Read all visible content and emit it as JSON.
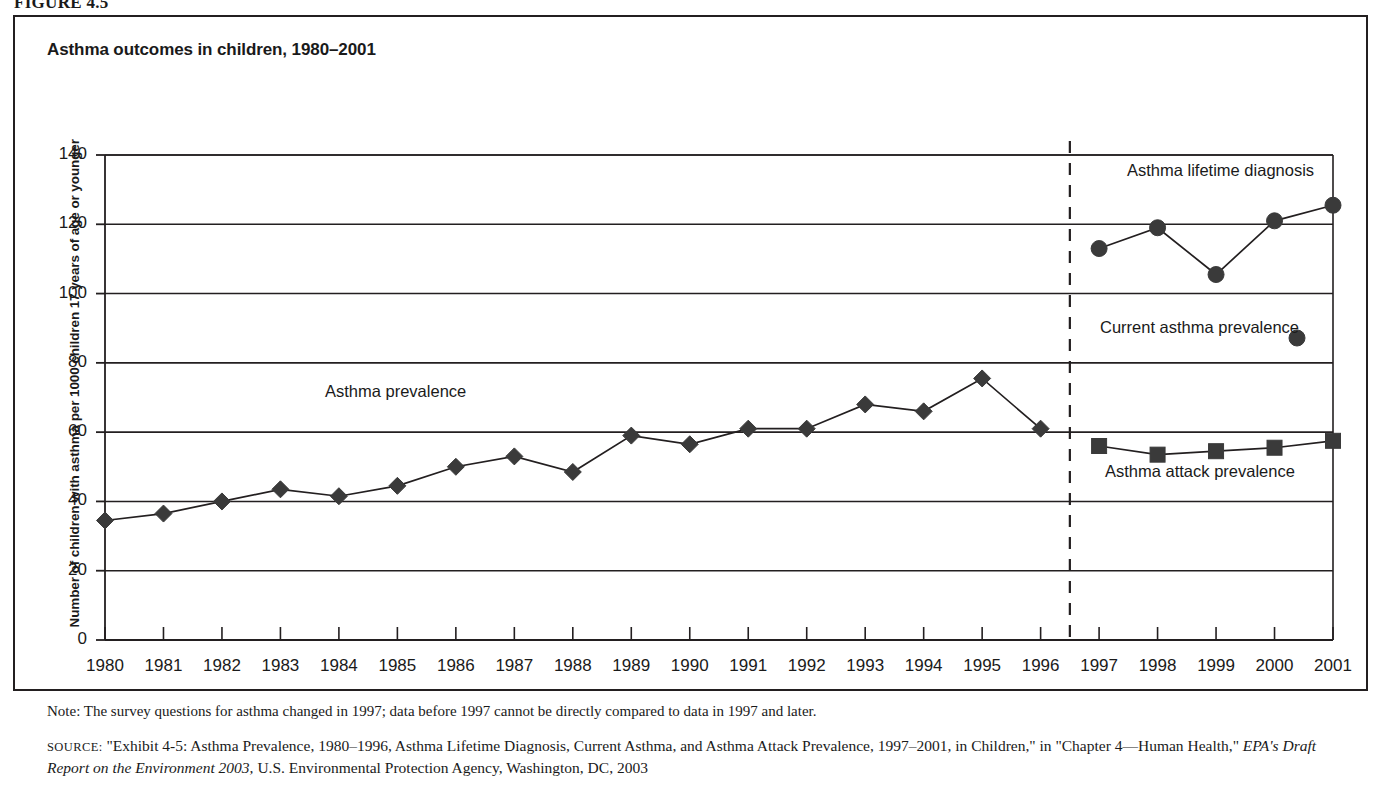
{
  "figure": {
    "label": "FIGURE 4.5",
    "title": "Asthma outcomes in children, 1980–2001"
  },
  "axes": {
    "ylabel": "Number of children with asthma per 1000 children 17 years of age or younger",
    "yticks": [
      "0",
      "20",
      "40",
      "60",
      "80",
      "100",
      "120",
      "140"
    ],
    "xticks": [
      "1980",
      "1981",
      "1982",
      "1983",
      "1984",
      "1985",
      "1986",
      "1987",
      "1988",
      "1989",
      "1990",
      "1991",
      "1992",
      "1993",
      "1994",
      "1995",
      "1996",
      "1997",
      "1998",
      "1999",
      "2000",
      "2001"
    ]
  },
  "annotations": {
    "asthma_prevalence": "Asthma prevalence",
    "lifetime_diagnosis": "Asthma lifetime diagnosis",
    "current_prevalence": "Current asthma prevalence",
    "attack_prevalence": "Asthma attack prevalence"
  },
  "note": "Note: The survey questions for asthma changed in 1997; data before 1997 cannot be directly compared to data in 1997 and later.",
  "source": {
    "prefix": "SOURCE:",
    "part1": " \"Exhibit 4-5: Asthma Prevalence, 1980–1996, Asthma Lifetime Diagnosis, Current Asthma, and Asthma Attack Prevalence, 1997–2001, in Children,\" in \"Chapter 4—Human Health,\" ",
    "italic": "EPA's Draft Report on the Environment 2003,",
    "part2": " U.S. Environmental Protection Agency, Washington, DC, 2003"
  },
  "colors": {
    "ink": "#231f20",
    "marker": "#3a3a3a",
    "background": "#ffffff"
  },
  "chart_data": {
    "type": "line",
    "title": "Asthma outcomes in children, 1980–2001",
    "xlabel": "",
    "ylabel": "Number of children with asthma per 1000 children 17 years of age or younger",
    "ylim": [
      0,
      140
    ],
    "ytick_step": 20,
    "grid": "horizontal",
    "legend": "inline-annotations",
    "break_after_year": 1996,
    "break_note": "Survey questions changed in 1997; vertical dashed line marks the break",
    "series": [
      {
        "name": "Asthma prevalence",
        "marker": "diamond",
        "x": [
          1980,
          1981,
          1982,
          1983,
          1984,
          1985,
          1986,
          1987,
          1988,
          1989,
          1990,
          1991,
          1992,
          1993,
          1994,
          1995,
          1996
        ],
        "values": [
          34.5,
          36.5,
          40.0,
          43.5,
          41.5,
          44.5,
          50.0,
          53.0,
          48.5,
          59.0,
          56.5,
          61.0,
          61.0,
          68.0,
          66.0,
          75.5,
          61.0
        ]
      },
      {
        "name": "Asthma lifetime diagnosis",
        "marker": "circle",
        "x": [
          1997,
          1998,
          1999,
          2000,
          2001
        ],
        "values": [
          113.0,
          119.0,
          105.5,
          121.0,
          125.5
        ]
      },
      {
        "name": "Asthma attack prevalence",
        "marker": "square",
        "x": [
          1997,
          1998,
          1999,
          2000,
          2001
        ],
        "values": [
          56.0,
          53.5,
          54.5,
          55.5,
          57.5
        ]
      },
      {
        "name": "Current asthma prevalence",
        "marker": "circle",
        "x": [],
        "values": [],
        "note": "legend entry only; no plotted points visible"
      }
    ]
  }
}
